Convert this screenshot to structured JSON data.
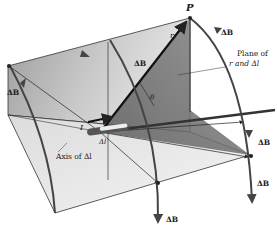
{
  "diagram": {
    "labels": {
      "point_p": "P",
      "r": "r",
      "theta": "θ",
      "current": "I",
      "dl": "Δl",
      "axis": "Axis of Δl",
      "plane_line1": "Plane of",
      "plane_line2": "r and Δl",
      "db": "ΔB"
    },
    "colors": {
      "plane_dark": "#6a6a6a",
      "plane_light": "#d8d8d8",
      "arc": "#444444",
      "line": "#222222"
    }
  }
}
